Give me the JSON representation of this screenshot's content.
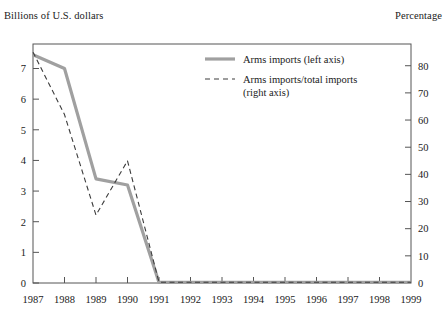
{
  "chart_data": {
    "type": "line",
    "title": "",
    "xlabel": "",
    "ylabel": "Billions of U.S. dollars",
    "y2label": "Percentage",
    "x": [
      1987,
      1988,
      1989,
      1990,
      1991,
      1992,
      1993,
      1994,
      1995,
      1996,
      1997,
      1998,
      1999
    ],
    "xtick_labels": [
      "1987",
      "1988",
      "1989",
      "1990",
      "1991",
      "1992",
      "1993",
      "1994",
      "1995",
      "1996",
      "1997",
      "1998",
      "1999"
    ],
    "ylim": [
      0,
      7.8
    ],
    "yticks": [
      0,
      1,
      2,
      3,
      4,
      5,
      6,
      7
    ],
    "ytick_labels": [
      "0",
      "1",
      "2",
      "3",
      "4",
      "5",
      "6",
      "7"
    ],
    "y2lim": [
      0,
      88
    ],
    "y2ticks": [
      0,
      10,
      20,
      30,
      40,
      50,
      60,
      70,
      80
    ],
    "y2tick_labels": [
      "0",
      "10",
      "20",
      "30",
      "40",
      "50",
      "60",
      "70",
      "80"
    ],
    "grid": false,
    "legend_position": "top-center",
    "series": [
      {
        "name": "Arms imports (left axis)",
        "axis": "left",
        "style": "solid",
        "color": "#a0a0a0",
        "width": 3.2,
        "values": [
          7.45,
          7.0,
          3.4,
          3.2,
          0.02,
          0.02,
          0.02,
          0.02,
          0.02,
          0.02,
          0.02,
          0.02,
          0.02
        ]
      },
      {
        "name": "Arms imports/total imports (right axis)",
        "axis": "right",
        "style": "dashed",
        "color": "#3c3c3c",
        "width": 1.1,
        "values": [
          85,
          62,
          25,
          45,
          0.3,
          0.3,
          0.3,
          0.3,
          0.3,
          0.3,
          0.3,
          0.3,
          0.3
        ]
      }
    ],
    "legend": [
      {
        "label": "Arms imports (left axis)",
        "style": "solid",
        "color": "#a0a0a0"
      },
      {
        "label": "Arms imports/total imports",
        "label2": "(right axis)",
        "style": "dashed",
        "color": "#3c3c3c"
      }
    ]
  },
  "labels": {
    "left_axis_title": "Billions of U.S. dollars",
    "right_axis_title": "Percentage"
  },
  "colors": {
    "solid_series": "#a0a0a0",
    "dashed_series": "#3c3c3c",
    "frame": "#555555",
    "text": "#1a1a1a"
  }
}
